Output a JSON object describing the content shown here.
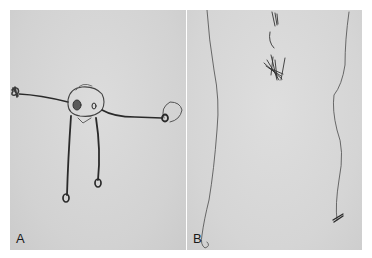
{
  "figure": {
    "panels": [
      {
        "id": "A",
        "label": "A",
        "content": "child drawing of a human figure with head, outstretched arms and two legs"
      },
      {
        "id": "B",
        "label": "B",
        "content": "child drawing of two long wavy vertical lines with a scribble at the top"
      }
    ],
    "colors": {
      "background": "#ffffff",
      "paper": "#d4d4d4",
      "pencil": "#2a2a2a"
    }
  }
}
